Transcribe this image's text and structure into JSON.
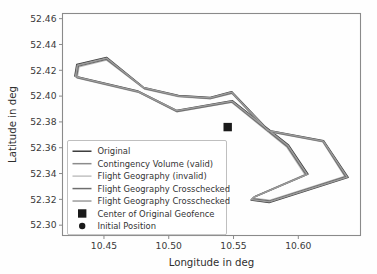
{
  "chart_data": {
    "type": "line",
    "title": "",
    "xlabel": "Longitude  in deg",
    "ylabel": "Latitude  in deg",
    "xlim": [
      10.418,
      10.648
    ],
    "ylim": [
      52.292,
      52.464
    ],
    "xticks": [
      "10.45",
      "10.50",
      "10.55",
      "10.60"
    ],
    "xtick_values": [
      10.45,
      10.5,
      10.55,
      10.6
    ],
    "yticks": [
      "52.30",
      "52.32",
      "52.34",
      "52.36",
      "52.38",
      "52.40",
      "52.42",
      "52.44",
      "52.46"
    ],
    "ytick_values": [
      52.3,
      52.32,
      52.34,
      52.36,
      52.38,
      52.4,
      52.42,
      52.44,
      52.46
    ],
    "grid": false,
    "legend_position": "lower left",
    "series": [
      {
        "name": "Original",
        "color": "#3f3f3f",
        "kind": "closed-polygon",
        "points": [
          [
            10.429,
            52.4245
          ],
          [
            10.452,
            52.43
          ],
          [
            10.4805,
            52.4068
          ],
          [
            10.5075,
            52.4005
          ],
          [
            10.532,
            52.399
          ],
          [
            10.5485,
            52.4035
          ],
          [
            10.577,
            52.3735
          ],
          [
            10.6195,
            52.3655
          ],
          [
            10.6385,
            52.337
          ],
          [
            10.5775,
            52.3175
          ],
          [
            10.5635,
            52.3195
          ],
          [
            10.5655,
            52.3215
          ],
          [
            10.6075,
            52.3395
          ],
          [
            10.5925,
            52.362
          ],
          [
            10.549,
            52.3965
          ],
          [
            10.506,
            52.389
          ],
          [
            10.476,
            52.404
          ],
          [
            10.4275,
            52.4155
          ]
        ]
      },
      {
        "name": "Contingency Volume (valid)",
        "color": "#8c8c8c",
        "kind": "closed-polygon",
        "points": [
          [
            10.4298,
            52.4236
          ],
          [
            10.452,
            52.429
          ],
          [
            10.4808,
            52.4062
          ],
          [
            10.5076,
            52.4
          ],
          [
            10.532,
            52.3984
          ],
          [
            10.5486,
            52.4028
          ],
          [
            10.5768,
            52.373
          ],
          [
            10.6192,
            52.365
          ],
          [
            10.6372,
            52.3374
          ],
          [
            10.5778,
            52.3184
          ],
          [
            10.5642,
            52.3202
          ],
          [
            10.5662,
            52.322
          ],
          [
            10.6064,
            52.3394
          ],
          [
            10.5918,
            52.3614
          ],
          [
            10.5488,
            52.3958
          ],
          [
            10.5062,
            52.3884
          ],
          [
            10.4764,
            52.4034
          ],
          [
            10.4284,
            52.4148
          ]
        ]
      },
      {
        "name": "Flight Geography (invalid)",
        "color": "#c2c2c2",
        "kind": "closed-polygon",
        "points": [
          [
            10.4308,
            52.4226
          ],
          [
            10.452,
            52.4278
          ],
          [
            10.4812,
            52.4054
          ],
          [
            10.5078,
            52.3994
          ],
          [
            10.532,
            52.3977
          ],
          [
            10.5488,
            52.4019
          ],
          [
            10.5765,
            52.3724
          ],
          [
            10.6188,
            52.3644
          ],
          [
            10.6356,
            52.3379
          ],
          [
            10.5782,
            52.3195
          ],
          [
            10.5651,
            52.3211
          ],
          [
            10.5671,
            52.3227
          ],
          [
            10.605,
            52.3392
          ],
          [
            10.5909,
            52.3606
          ],
          [
            10.5486,
            52.395
          ],
          [
            10.5065,
            52.3877
          ],
          [
            10.4769,
            52.4027
          ],
          [
            10.4295,
            52.4139
          ]
        ]
      },
      {
        "name": "Flight Geography Crosschecked",
        "color": "#6e6e6e",
        "kind": "closed-polygon",
        "points": [
          [
            10.4303,
            52.4231
          ],
          [
            10.452,
            52.4284
          ],
          [
            10.481,
            52.4058
          ],
          [
            10.5077,
            52.3997
          ],
          [
            10.532,
            52.398
          ],
          [
            10.5487,
            52.4023
          ],
          [
            10.5766,
            52.3727
          ],
          [
            10.619,
            52.3647
          ],
          [
            10.6364,
            52.3376
          ],
          [
            10.578,
            52.3189
          ],
          [
            10.5646,
            52.3206
          ],
          [
            10.5666,
            52.3223
          ],
          [
            10.6057,
            52.3393
          ],
          [
            10.5913,
            52.361
          ],
          [
            10.5487,
            52.3954
          ],
          [
            10.5063,
            52.388
          ],
          [
            10.4766,
            52.403
          ],
          [
            10.4289,
            52.4143
          ]
        ]
      },
      {
        "name": "Flight Geography Crosschecked",
        "color": "#9c9c9c",
        "kind": "closed-polygon",
        "points": [
          [
            10.4294,
            52.424
          ],
          [
            10.452,
            52.4295
          ],
          [
            10.4806,
            52.4065
          ],
          [
            10.5075,
            52.4002
          ],
          [
            10.532,
            52.3987
          ],
          [
            10.5485,
            52.4031
          ],
          [
            10.5769,
            52.3732
          ],
          [
            10.6193,
            52.3652
          ],
          [
            10.6378,
            52.3372
          ],
          [
            10.5776,
            52.318
          ],
          [
            10.5638,
            52.3198
          ],
          [
            10.5658,
            52.3217
          ],
          [
            10.6069,
            52.3394
          ],
          [
            10.5921,
            52.3617
          ],
          [
            10.5489,
            52.3961
          ],
          [
            10.5061,
            52.3887
          ],
          [
            10.4762,
            52.4037
          ],
          [
            10.428,
            52.4151
          ]
        ]
      }
    ],
    "markers": [
      {
        "name": "Center of Original Geofence",
        "shape": "square",
        "color": "#1a1a1a",
        "point": [
          10.5455,
          52.376
        ]
      },
      {
        "name": "Initial Position",
        "shape": "circle",
        "color": "#1a1a1a",
        "point": null
      }
    ],
    "legend_entries": [
      {
        "label": "Original",
        "color": "#3f3f3f",
        "marker": "line"
      },
      {
        "label": "Contingency Volume (valid)",
        "color": "#8c8c8c",
        "marker": "line"
      },
      {
        "label": "Flight Geography (invalid)",
        "color": "#c2c2c2",
        "marker": "line"
      },
      {
        "label": "Flight Geography Crosschecked",
        "color": "#6e6e6e",
        "marker": "line"
      },
      {
        "label": "Flight Geography Crosschecked",
        "color": "#9c9c9c",
        "marker": "line"
      },
      {
        "label": "Center of Original Geofence",
        "color": "#1a1a1a",
        "marker": "square"
      },
      {
        "label": "Initial Position",
        "color": "#1a1a1a",
        "marker": "circle"
      }
    ]
  }
}
